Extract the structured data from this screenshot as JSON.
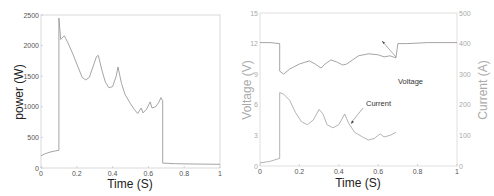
{
  "chart_data": [
    {
      "type": "line",
      "title": "",
      "xlabel": "Time (S)",
      "ylabel": "power (W)",
      "xlim": [
        0,
        1
      ],
      "ylim": [
        0,
        2500
      ],
      "xticks": [
        0,
        0.2,
        0.4,
        0.6,
        0.8,
        1
      ],
      "xtick_labels": [
        "0",
        "0.2",
        "0.4",
        "0.6",
        "0.8",
        "1"
      ],
      "yticks": [
        0,
        500,
        1000,
        1500,
        2000,
        2500
      ],
      "ytick_labels": [
        "0",
        "500",
        "1000",
        "1500",
        "2000",
        "2500"
      ],
      "grid": false,
      "series": [
        {
          "name": "power",
          "x": [
            0,
            0.02,
            0.05,
            0.08,
            0.1,
            0.1,
            0.11,
            0.13,
            0.15,
            0.18,
            0.2,
            0.23,
            0.25,
            0.27,
            0.29,
            0.31,
            0.32,
            0.34,
            0.36,
            0.38,
            0.4,
            0.42,
            0.43,
            0.45,
            0.47,
            0.5,
            0.52,
            0.54,
            0.56,
            0.57,
            0.59,
            0.61,
            0.62,
            0.64,
            0.66,
            0.67,
            0.68,
            0.68,
            0.75,
            0.85,
            1.0
          ],
          "y": [
            200,
            230,
            260,
            280,
            290,
            2450,
            2100,
            2160,
            2050,
            1850,
            1700,
            1480,
            1440,
            1480,
            1650,
            1820,
            1840,
            1600,
            1400,
            1310,
            1330,
            1500,
            1650,
            1380,
            1200,
            1050,
            960,
            890,
            980,
            900,
            960,
            1080,
            980,
            1000,
            1080,
            1150,
            1100,
            80,
            70,
            65,
            60
          ]
        }
      ]
    },
    {
      "type": "line",
      "title": "",
      "xlabel": "Time (S)",
      "ylabel": "Voltage (V)",
      "ylabel_right": "Current (A)",
      "xlim": [
        0,
        1
      ],
      "ylim": [
        0,
        15
      ],
      "ylim_right": [
        0,
        500
      ],
      "xticks": [
        0,
        0.2,
        0.4,
        0.6,
        0.8,
        1
      ],
      "xtick_labels": [
        "0",
        "0.2",
        "0.4",
        "0.6",
        "0.8",
        "1"
      ],
      "yticks": [
        0,
        3,
        6,
        9,
        12,
        15
      ],
      "ytick_labels": [
        "0",
        "3",
        "6",
        "9",
        "12",
        "15"
      ],
      "yticks_right": [
        0,
        100,
        200,
        300,
        400,
        500
      ],
      "ytick_labels_right": [
        "0",
        "100",
        "200",
        "300",
        "400",
        "500"
      ],
      "grid": false,
      "series": [
        {
          "name": "Voltage",
          "axis": "left",
          "x": [
            0,
            0.05,
            0.1,
            0.1,
            0.12,
            0.15,
            0.2,
            0.25,
            0.28,
            0.31,
            0.33,
            0.36,
            0.39,
            0.42,
            0.44,
            0.47,
            0.5,
            0.55,
            0.6,
            0.63,
            0.66,
            0.69,
            0.7,
            0.75,
            0.85,
            1.0
          ],
          "y": [
            12.1,
            12.1,
            12.0,
            9.3,
            9.0,
            9.5,
            10.0,
            10.3,
            10.0,
            9.6,
            10.0,
            10.4,
            10.2,
            9.9,
            10.0,
            10.4,
            10.8,
            11.0,
            10.9,
            10.7,
            10.8,
            10.6,
            12.0,
            12.0,
            12.1,
            12.1
          ]
        },
        {
          "name": "Current",
          "axis": "right",
          "x": [
            0,
            0.05,
            0.1,
            0.1,
            0.12,
            0.15,
            0.18,
            0.21,
            0.24,
            0.27,
            0.3,
            0.32,
            0.34,
            0.37,
            0.4,
            0.43,
            0.45,
            0.48,
            0.52,
            0.55,
            0.58,
            0.61,
            0.63,
            0.66,
            0.69
          ],
          "y": [
            10,
            15,
            25,
            240,
            235,
            215,
            175,
            145,
            135,
            150,
            185,
            170,
            135,
            125,
            135,
            170,
            140,
            110,
            95,
            85,
            90,
            105,
            95,
            100,
            110
          ]
        }
      ],
      "annotations": [
        {
          "text": "Voltage",
          "x": 0.72,
          "y": 8.6,
          "arrow_to": [
            0.62,
            10.9
          ]
        },
        {
          "text": "Current",
          "x": 0.53,
          "y": 6.3,
          "arrow_to": [
            0.46,
            4.2
          ]
        }
      ]
    }
  ],
  "left_chart": {
    "xlabel": "Time (S)",
    "ylabel": "power (W)",
    "xtick_labels": [
      "0",
      "0.2",
      "0.4",
      "0.6",
      "0.8",
      "1"
    ],
    "ytick_labels": [
      "0",
      "500",
      "1000",
      "1500",
      "2000",
      "2500"
    ]
  },
  "right_chart": {
    "xlabel": "Time (S)",
    "ylabel_left": "Voltage (V)",
    "ylabel_right": "Current (A)",
    "xtick_labels": [
      "0",
      "0.2",
      "0.4",
      "0.6",
      "0.8",
      "1"
    ],
    "ytick_labels_left": [
      "0",
      "3",
      "6",
      "9",
      "12",
      "15"
    ],
    "ytick_labels_right": [
      "0",
      "100",
      "200",
      "300",
      "400",
      "500"
    ],
    "annotation_voltage": "Voltage",
    "annotation_current": "Current"
  },
  "colors": {
    "axis": "#c8c8c8",
    "line": "#9a9a9a",
    "text_dark": "#222222",
    "text_light": "#aaaaaa"
  }
}
